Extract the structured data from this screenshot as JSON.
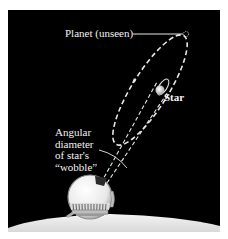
{
  "diagram": {
    "labels": {
      "planet": "Planet (unseen)",
      "star": "Star",
      "angular_lines": [
        "Angular",
        "diameter",
        "of star's",
        "“wobble”"
      ]
    },
    "colors": {
      "background": "#000000",
      "frame": "#ffffff",
      "lines": "#e6e6e6",
      "text": "#f2f2f2",
      "star": "#d9d9d9",
      "observatory": "#ececec"
    },
    "elements": [
      "planet-orbit-ellipse",
      "star-orbit-ellipse",
      "planet-marker",
      "star",
      "sight-lines",
      "angle-arc",
      "observatory-dome",
      "ground"
    ]
  }
}
